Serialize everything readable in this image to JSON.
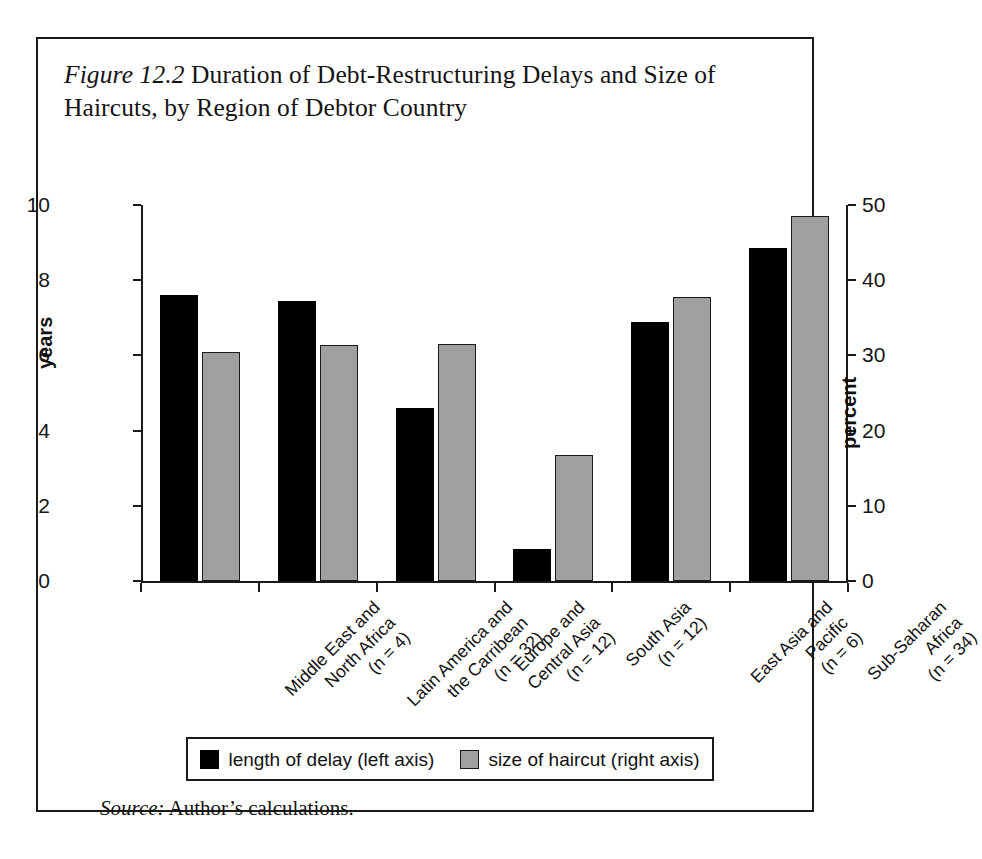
{
  "figure": {
    "label": "Figure 12.2",
    "title_text": " Duration of Debt-Restructuring Delays and Size of Haircuts, by Region of Debtor Country",
    "source_label": "Source:",
    "source_text": " Author’s calculations."
  },
  "legend": {
    "entries": [
      {
        "label": "length of delay (left axis)",
        "color": "#000000"
      },
      {
        "label": "size of haircut (right axis)",
        "color": "#a0a0a0"
      }
    ]
  },
  "chart_data": {
    "type": "bar",
    "title": "Figure 12.2 Duration of Debt-Restructuring Delays and Size of Haircuts, by Region of Debtor Country",
    "xlabel": "",
    "ylabel": "years",
    "y2label": "percent",
    "ylim": [
      0,
      10
    ],
    "y2lim": [
      0,
      50
    ],
    "yticks": [
      "0",
      "2",
      "4",
      "6",
      "8",
      "10"
    ],
    "y2ticks": [
      "0",
      "10",
      "20",
      "30",
      "40",
      "50"
    ],
    "grid": false,
    "legend_position": "bottom",
    "categories": [
      "Middle East and\nNorth Africa\n(n = 4)",
      "Latin America and\nthe Carribean\n(n = 32)",
      "Europe and\nCentral Asia\n(n = 12)",
      "South Asia\n(n = 12)",
      "East Asia and\nPacific\n(n = 6)",
      "Sub-Saharan\nAfrica\n(n = 34)"
    ],
    "category_lines": [
      [
        "Middle East and",
        "North Africa",
        "(n = 4)"
      ],
      [
        "Latin America and",
        "the Carribean",
        "(n = 32)"
      ],
      [
        "Europe and",
        "Central Asia",
        "(n = 12)"
      ],
      [
        "South Asia",
        "(n = 12)"
      ],
      [
        "East Asia and",
        "Pacific",
        "(n = 6)"
      ],
      [
        "Sub-Saharan",
        "Africa",
        "(n = 34)"
      ]
    ],
    "series": [
      {
        "name": "length of delay (left axis)",
        "axis": "left",
        "unit": "years",
        "color": "#000000",
        "values": [
          7.6,
          7.45,
          4.6,
          0.85,
          6.9,
          8.85
        ]
      },
      {
        "name": "size of haircut (right axis)",
        "axis": "right",
        "unit": "percent",
        "color": "#a0a0a0",
        "values": [
          30.5,
          31.4,
          31.5,
          16.7,
          37.8,
          48.5
        ]
      }
    ]
  }
}
